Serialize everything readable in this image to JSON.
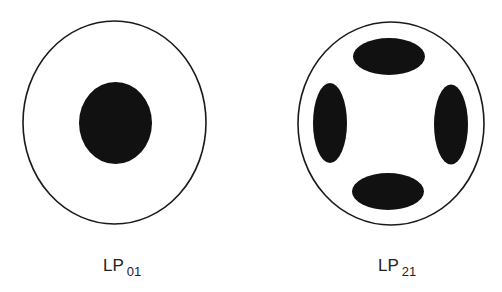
{
  "diagram": {
    "type": "fiber-mode-intensity-patterns",
    "colors": {
      "outline": "#1a1a1a",
      "fill": "#111111",
      "background": "#ffffff"
    },
    "modes": [
      {
        "name": "LP",
        "subscript": "01",
        "lobes": 1
      },
      {
        "name": "LP",
        "subscript": "21",
        "lobes": 4
      }
    ]
  }
}
